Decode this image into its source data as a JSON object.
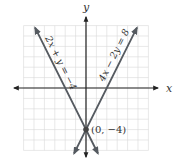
{
  "chart_data": {
    "type": "line",
    "title": "",
    "xlabel": "x",
    "ylabel": "y",
    "xlim": [
      -6,
      6
    ],
    "ylim": [
      -6,
      6
    ],
    "grid": true,
    "series": [
      {
        "name": "2x + y = −4",
        "equation": "y = -2x - 4",
        "slope": -2,
        "intercept": -4,
        "color": "#555a60"
      },
      {
        "name": "4x − 2y = 8",
        "equation": "y = 2x - 4",
        "slope": 2,
        "intercept": -4,
        "color": "#555a60"
      }
    ],
    "annotations": [
      {
        "text": "(0, −4)",
        "x": 0,
        "y": -4,
        "type": "intersection-point"
      }
    ]
  },
  "labels": {
    "x_axis": "x",
    "y_axis": "y",
    "line1": "2x + y = −4",
    "line2": "4x − 2y = 8",
    "point": "(0, −4)"
  }
}
